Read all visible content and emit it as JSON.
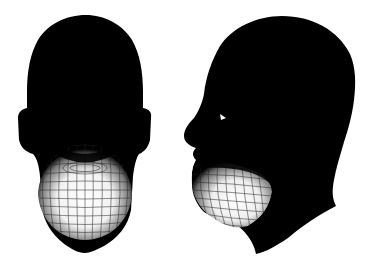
{
  "scene": {
    "background": "#ffffff",
    "silhouette_color": "#000000",
    "mesh_color": "#ffffff",
    "views": [
      {
        "id": "front",
        "label": "front view head mesh"
      },
      {
        "id": "side",
        "label": "side profile head mesh"
      }
    ]
  }
}
